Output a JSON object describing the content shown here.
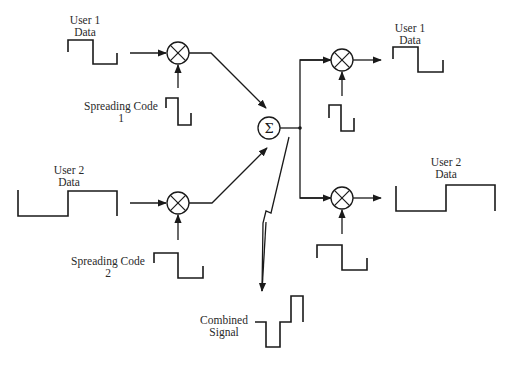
{
  "diagram": {
    "labels": {
      "user1_input": {
        "line1": "User 1",
        "line2": "Data"
      },
      "user2_input": {
        "line1": "User 2",
        "line2": "Data"
      },
      "spreading_code_1": {
        "line1": "Spreading Code",
        "line2": "1"
      },
      "spreading_code_2": {
        "line1": "Spreading Code",
        "line2": "2"
      },
      "user1_output": {
        "line1": "User 1",
        "line2": "Data"
      },
      "user2_output": {
        "line1": "User 2",
        "line2": "Data"
      },
      "combined_signal": {
        "line1": "Combined",
        "line2": "Signal"
      }
    },
    "nodes": [
      {
        "id": "multiplier-1",
        "symbol": "⊗",
        "type": "multiplier"
      },
      {
        "id": "multiplier-2",
        "symbol": "⊗",
        "type": "multiplier"
      },
      {
        "id": "summer",
        "symbol": "Σ",
        "type": "summation"
      },
      {
        "id": "multiplier-3",
        "symbol": "⊗",
        "type": "multiplier"
      },
      {
        "id": "multiplier-4",
        "symbol": "⊗",
        "type": "multiplier"
      }
    ],
    "sum_symbol": "Σ",
    "colors": {
      "line": "#1a1a1a",
      "text": "#2a2a2a",
      "background": "#ffffff"
    }
  }
}
